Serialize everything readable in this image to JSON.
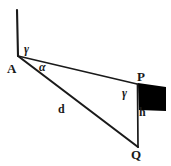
{
  "figure": {
    "kind": "geometry-diagram",
    "background_color": "#ffffff",
    "stroke_color": "#1a1a1a",
    "fill_color": "#000000",
    "points": {
      "A": {
        "label": "A",
        "x": 18,
        "y": 56
      },
      "P": {
        "label": "P",
        "x": 137,
        "y": 84
      },
      "Q": {
        "label": "Q",
        "x": 138,
        "y": 147
      },
      "V": {
        "label": "",
        "x": 17,
        "y": 10
      }
    },
    "segments": [
      {
        "name": "vertical-reference-at-A",
        "from": "V",
        "to": "A"
      },
      {
        "name": "line-of-sight-A-to-P",
        "from": "A",
        "to": "P"
      },
      {
        "name": "line-of-sight-A-to-Q",
        "from": "A",
        "to": "Q"
      },
      {
        "name": "vertical-P-to-Q",
        "from": "P",
        "to": "Q"
      }
    ],
    "angle_labels": [
      {
        "name": "gamma-at-A",
        "text": "γ",
        "at": "A"
      },
      {
        "name": "alpha-at-A",
        "text": "α",
        "at": "A"
      },
      {
        "name": "gamma-at-P",
        "text": "γ",
        "at": "P"
      }
    ],
    "length_labels": [
      {
        "name": "distance-d",
        "text": "d",
        "on": "A-Q"
      },
      {
        "name": "height-h",
        "text": "h",
        "on": "P-Q"
      }
    ],
    "filled_shape": {
      "name": "black-parallelogram-at-P",
      "fill": "#000000",
      "vertices": [
        [
          138,
          83
        ],
        [
          166,
          87
        ],
        [
          166,
          111
        ],
        [
          139,
          110
        ]
      ]
    }
  }
}
